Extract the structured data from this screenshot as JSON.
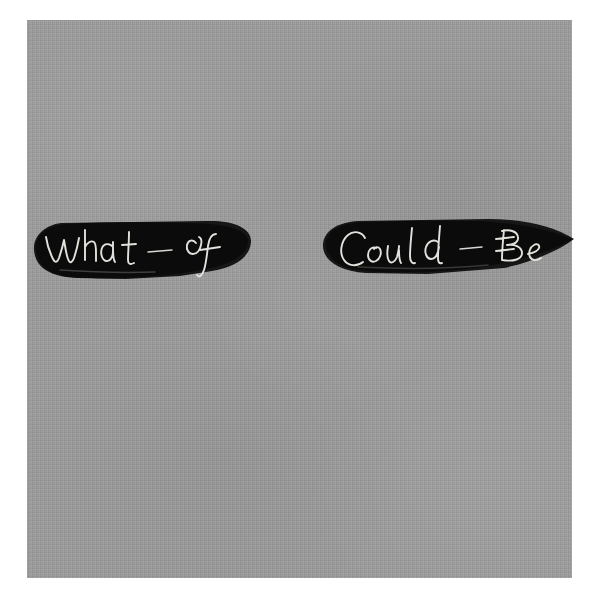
{
  "artwork": {
    "title": "What - If / Could - Be",
    "medium_surface": "gray woven canvas",
    "canvas": {
      "background_color": "#9b9b9b",
      "page_color": "#ffffff",
      "left": 27,
      "top": 20,
      "width": 545,
      "height": 558
    },
    "marks": [
      {
        "name": "left-brush-blob",
        "shape": "horizontal rounded brushstroke blob, blunt rounded left end, slightly tapered right end",
        "fill_color": "#0b0b0b",
        "text": "What - If",
        "words": [
          "What",
          "-",
          "If"
        ],
        "script": "cursive handwriting scratched through black paint",
        "stroke_color": "#e2e2dc",
        "left": 30,
        "top": 212,
        "width": 224,
        "height": 80
      },
      {
        "name": "right-brush-blob",
        "shape": "horizontal elongated brushstroke blob tapering to a sharp point at the right",
        "fill_color": "#0b0b0b",
        "text": "Could - Be",
        "words": [
          "Could",
          "-",
          "Be"
        ],
        "script": "cursive handwriting scratched through black paint",
        "stroke_color": "#e2e2dc",
        "left": 318,
        "top": 210,
        "width": 258,
        "height": 80
      }
    ],
    "full_text": "What - If     Could - Be"
  }
}
